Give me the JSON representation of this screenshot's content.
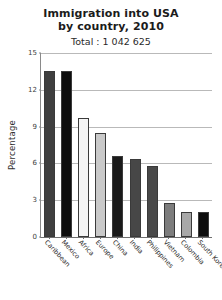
{
  "chart_data": {
    "type": "bar",
    "title": "Immigration into USA by country, 2010",
    "title_lines": [
      "Immigration into USA",
      "by country, 2010"
    ],
    "subtitle": "Total : 1 042 625",
    "xlabel": "",
    "ylabel": "Percentage",
    "ylim": [
      0,
      15
    ],
    "yticks": [
      0,
      3,
      6,
      9,
      12,
      15
    ],
    "ytick_labels": [
      "0",
      "3",
      "6",
      "9",
      "12",
      "15"
    ],
    "grid": true,
    "legend": "none",
    "categories": [
      "Caribbean",
      "Mexico",
      "Africa",
      "Europe",
      "China",
      "India",
      "Philippines",
      "Vietnam",
      "Colombia",
      "South Korea"
    ],
    "values": [
      13.5,
      13.5,
      9.7,
      8.5,
      6.6,
      6.4,
      5.8,
      2.8,
      2.0,
      2.0
    ],
    "bar_colors": [
      "#3f3f3f",
      "#0d0d0d",
      "#f4f4f4",
      "#c9c9c9",
      "#1a1a1a",
      "#474747",
      "#494949",
      "#7d7d7d",
      "#a8a8a8",
      "#0d0d0d"
    ],
    "bar_edge_color": "#3a3a3a",
    "grid_color": "#b9b9b9",
    "axis_color": "#6f6f6f",
    "background": "#ffffff"
  }
}
